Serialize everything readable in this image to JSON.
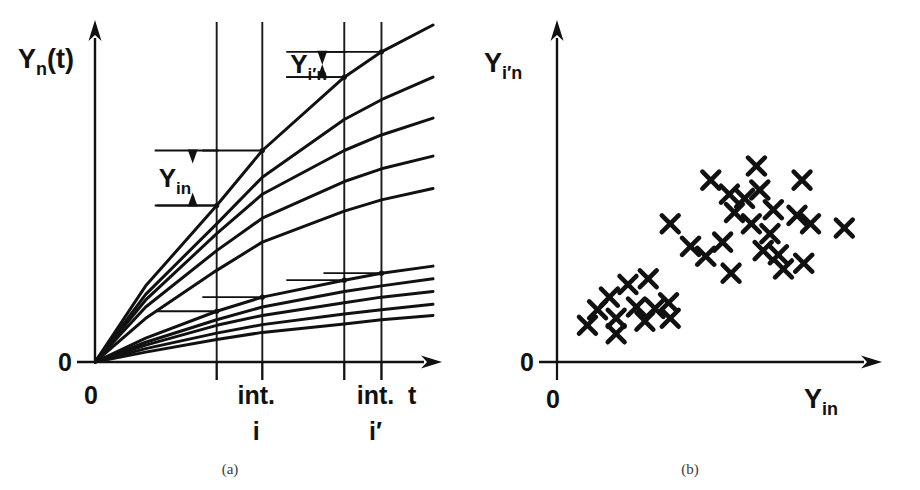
{
  "figure": {
    "panels": [
      {
        "id": "a",
        "caption": "(a)",
        "y_axis": {
          "label_main": "Y",
          "label_sub": "n",
          "label_tail": "(t)",
          "origin_label": "0"
        },
        "x_axis": {
          "label": "t",
          "origin_label": "0"
        },
        "interval_labels": [
          {
            "line1": "int.",
            "line2": "i"
          },
          {
            "line1": "int.",
            "line2": "i′"
          }
        ],
        "annotations": [
          {
            "name": "Y-in-bracket",
            "main": "Y",
            "sub": "in"
          },
          {
            "name": "Y-iprime-n-bracket",
            "main": "Y",
            "sub": "i′n"
          }
        ]
      },
      {
        "id": "b",
        "caption": "(b)",
        "y_axis": {
          "label_main": "Y",
          "label_sub": "i′n",
          "origin_label": "0"
        },
        "x_axis": {
          "label_main": "Y",
          "label_sub": "in",
          "origin_label": "0"
        }
      }
    ]
  },
  "chart_data": [
    {
      "type": "line",
      "panel": "a",
      "title": "",
      "xlabel": "t",
      "ylabel": "Y_n(t)",
      "xlim": [
        0,
        400
      ],
      "ylim": [
        0,
        345
      ],
      "grid": true,
      "grid_x_positions": [
        144,
        198,
        295,
        339
      ],
      "interval_markers": [
        {
          "label": "int. i",
          "x_from": 144,
          "x_to": 198
        },
        {
          "label": "int. i'",
          "x_from": 295,
          "x_to": 339
        }
      ],
      "note": "All curves emanate from origin (0,0); coordinates are in panel-local px units, y measured upward from the axis.",
      "series": [
        {
          "name": "n1",
          "x": [
            0,
            60,
            144,
            198,
            295,
            339,
            400
          ],
          "y": [
            0,
            108,
            222,
            300,
            404,
            440,
            478
          ]
        },
        {
          "name": "n2",
          "x": [
            0,
            60,
            144,
            198,
            295,
            339,
            400
          ],
          "y": [
            0,
            96,
            196,
            262,
            344,
            372,
            404
          ]
        },
        {
          "name": "n3",
          "x": [
            0,
            60,
            144,
            198,
            295,
            339,
            400
          ],
          "y": [
            0,
            88,
            182,
            238,
            300,
            322,
            346
          ]
        },
        {
          "name": "n4",
          "x": [
            0,
            60,
            144,
            198,
            295,
            339,
            400
          ],
          "y": [
            0,
            78,
            158,
            204,
            256,
            274,
            292
          ]
        },
        {
          "name": "n5",
          "x": [
            0,
            60,
            144,
            198,
            295,
            339,
            400
          ],
          "y": [
            0,
            62,
            130,
            170,
            214,
            230,
            246
          ]
        },
        {
          "name": "n6",
          "x": [
            0,
            60,
            144,
            198,
            295,
            339,
            400
          ],
          "y": [
            0,
            34,
            72,
            92,
            116,
            126,
            136
          ]
        },
        {
          "name": "n7",
          "x": [
            0,
            60,
            144,
            198,
            295,
            339,
            400
          ],
          "y": [
            0,
            28,
            60,
            78,
            100,
            108,
            118
          ]
        },
        {
          "name": "n8",
          "x": [
            0,
            60,
            144,
            198,
            295,
            339,
            400
          ],
          "y": [
            0,
            24,
            52,
            66,
            84,
            92,
            100
          ]
        },
        {
          "name": "n9",
          "x": [
            0,
            60,
            144,
            198,
            295,
            339,
            400
          ],
          "y": [
            0,
            19,
            41,
            53,
            68,
            74,
            82
          ]
        },
        {
          "name": "n10",
          "x": [
            0,
            60,
            144,
            198,
            295,
            339,
            400
          ],
          "y": [
            0,
            14,
            32,
            42,
            54,
            60,
            66
          ]
        }
      ],
      "value_markers": [
        {
          "series": "n1",
          "at_x": 295,
          "y": 404,
          "has_hline": true
        },
        {
          "series": "n1",
          "at_x": 339,
          "y": 440,
          "has_hline": true
        },
        {
          "series": "n1",
          "at_x": 144,
          "y": 222,
          "has_hline": true
        },
        {
          "series": "n1",
          "at_x": 198,
          "y": 300,
          "has_hline": true
        },
        {
          "series": "n6",
          "at_x": 295,
          "y": 116,
          "has_hline": true
        },
        {
          "series": "n6",
          "at_x": 339,
          "y": 126,
          "has_hline": true
        },
        {
          "series": "n6",
          "at_x": 144,
          "y": 72,
          "has_hline": true
        },
        {
          "series": "n6",
          "at_x": 198,
          "y": 92,
          "has_hline": true
        }
      ]
    },
    {
      "type": "scatter",
      "panel": "b",
      "title": "",
      "xlabel": "Y_in",
      "ylabel": "Y_i'n",
      "xlim": [
        0,
        400
      ],
      "ylim": [
        0,
        345
      ],
      "grid": false,
      "marker": "x",
      "clusters": [
        {
          "name": "low-low-cluster",
          "count": 12,
          "points": [
            [
              62,
              92
            ],
            [
              84,
              110
            ],
            [
              108,
              118
            ],
            [
              48,
              74
            ],
            [
              70,
              62
            ],
            [
              94,
              78
            ],
            [
              116,
              76
            ],
            [
              134,
              62
            ],
            [
              132,
              84
            ],
            [
              36,
              52
            ],
            [
              70,
              40
            ],
            [
              104,
              58
            ]
          ]
        },
        {
          "name": "high-high-cluster",
          "count": 22,
          "points": [
            [
              236,
              278
            ],
            [
              182,
              258
            ],
            [
              290,
              258
            ],
            [
              204,
              238
            ],
            [
              222,
              232
            ],
            [
              240,
              244
            ],
            [
              256,
              216
            ],
            [
              210,
              212
            ],
            [
              284,
              208
            ],
            [
              134,
              196
            ],
            [
              230,
              196
            ],
            [
              300,
              196
            ],
            [
              252,
              182
            ],
            [
              340,
              190
            ],
            [
              158,
              164
            ],
            [
              196,
              170
            ],
            [
              244,
              158
            ],
            [
              262,
              152
            ],
            [
              176,
              150
            ],
            [
              268,
              132
            ],
            [
              206,
              126
            ],
            [
              292,
              140
            ]
          ]
        }
      ]
    }
  ],
  "style": {
    "ink": "#111111",
    "grid_ink": "#1a1a1a",
    "caption_ink": "#3b3b3b",
    "background": "#ffffff"
  }
}
